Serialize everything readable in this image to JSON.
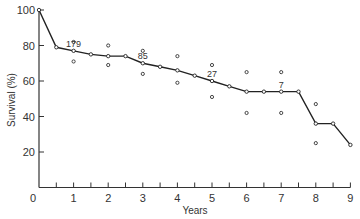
{
  "chart_data": {
    "type": "line",
    "title": "",
    "xlabel": "Years",
    "ylabel": "Survival (%)",
    "xlim": [
      0,
      9
    ],
    "ylim": [
      0,
      100
    ],
    "x_ticks_major": [
      0,
      1,
      2,
      3,
      4,
      5,
      6,
      7,
      8,
      9
    ],
    "x_ticks_minor": [
      0.5,
      1.5,
      2.5,
      3.5,
      4.5,
      5.5,
      6.5,
      7.5,
      8.5
    ],
    "y_ticks": [
      20,
      40,
      60,
      80,
      100
    ],
    "y_tick_labels": [
      "20",
      "40",
      "60",
      "80",
      "100"
    ],
    "origin_label": "0",
    "grid": false,
    "legend": null,
    "series": [
      {
        "name": "Survival",
        "x": [
          0,
          0.5,
          1.0,
          1.5,
          2.0,
          2.5,
          3.0,
          3.5,
          4.0,
          4.5,
          5.0,
          5.5,
          6.0,
          6.5,
          7.0,
          7.5,
          8.0,
          8.5,
          9.0
        ],
        "values": [
          100,
          79,
          77,
          75,
          74,
          74,
          70,
          68,
          66,
          63,
          60,
          57,
          54,
          54,
          54,
          54,
          36,
          36,
          24
        ]
      }
    ],
    "confidence_bounds": [
      {
        "x": 1,
        "upper": 82,
        "lower": 71
      },
      {
        "x": 2,
        "upper": 80,
        "lower": 69
      },
      {
        "x": 3,
        "upper": 77,
        "lower": 64
      },
      {
        "x": 4,
        "upper": 74,
        "lower": 59
      },
      {
        "x": 5,
        "upper": 69,
        "lower": 51
      },
      {
        "x": 6,
        "upper": 65,
        "lower": 42
      },
      {
        "x": 7,
        "upper": 65,
        "lower": 42
      },
      {
        "x": 8,
        "upper": 47,
        "lower": 25
      }
    ],
    "annotations": [
      {
        "x": 1,
        "y": 77,
        "text": "179"
      },
      {
        "x": 3,
        "y": 70,
        "text": "85"
      },
      {
        "x": 5,
        "y": 60,
        "text": "27"
      },
      {
        "x": 7,
        "y": 54,
        "text": "7"
      }
    ]
  }
}
